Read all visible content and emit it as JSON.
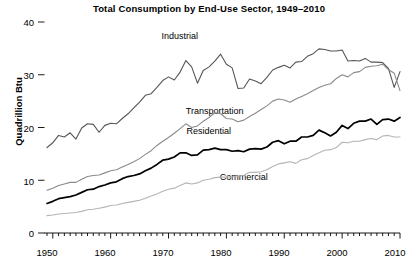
{
  "chart_data": {
    "type": "line",
    "title": "Total Consumption by End-Use Sector, 1949–2010",
    "xlabel": "",
    "ylabel": "Quadrillion Btu",
    "xlim": [
      1949,
      2010
    ],
    "ylim": [
      0,
      40
    ],
    "grid": false,
    "legend": "inline-annotations",
    "y_ticks": [
      0,
      10,
      20,
      30,
      40
    ],
    "y_tick_labels": [
      "0",
      "10",
      "20",
      "30",
      "40"
    ],
    "x_ticks": [
      1950,
      1960,
      1970,
      1980,
      1990,
      2000,
      2010
    ],
    "x_tick_labels": [
      "1950",
      "1960",
      "1970",
      "1980",
      "1990",
      "2000",
      "2010"
    ],
    "x_minor_tick_interval": 1,
    "x": [
      1949,
      1950,
      1951,
      1952,
      1953,
      1954,
      1955,
      1956,
      1957,
      1958,
      1959,
      1960,
      1961,
      1962,
      1963,
      1964,
      1965,
      1966,
      1967,
      1968,
      1969,
      1970,
      1971,
      1972,
      1973,
      1974,
      1975,
      1976,
      1977,
      1978,
      1979,
      1980,
      1981,
      1982,
      1983,
      1984,
      1985,
      1986,
      1987,
      1988,
      1989,
      1990,
      1991,
      1992,
      1993,
      1994,
      1995,
      1996,
      1997,
      1998,
      1999,
      2000,
      2001,
      2002,
      2003,
      2004,
      2005,
      2006,
      2007,
      2008,
      2009,
      2010
    ],
    "series": [
      {
        "name": "Industrial",
        "color": "#555555",
        "line_width": 1.1,
        "label_x": 1972,
        "label_y": 37.2,
        "values": [
          16.2,
          17.1,
          18.5,
          18.2,
          19.0,
          17.8,
          19.9,
          20.7,
          20.6,
          19.1,
          20.4,
          20.8,
          20.7,
          21.7,
          22.6,
          23.7,
          24.8,
          26.1,
          26.4,
          27.6,
          28.9,
          29.6,
          29.0,
          30.5,
          32.7,
          31.5,
          28.4,
          30.8,
          31.5,
          32.6,
          33.9,
          32.0,
          31.3,
          27.4,
          27.5,
          29.2,
          28.8,
          28.3,
          29.5,
          30.9,
          31.4,
          31.8,
          31.3,
          32.4,
          32.5,
          33.5,
          34.0,
          34.9,
          34.8,
          34.5,
          34.5,
          34.7,
          32.6,
          32.7,
          32.6,
          33.1,
          32.4,
          32.4,
          32.3,
          31.2,
          27.6,
          30.6
        ]
      },
      {
        "name": "Transportation",
        "color": "#8a8a8a",
        "line_width": 1.1,
        "label_x": 1978,
        "label_y": 23.0,
        "values": [
          8.1,
          8.5,
          9.0,
          9.3,
          9.6,
          9.6,
          10.2,
          10.7,
          10.9,
          11.0,
          11.4,
          11.8,
          12.0,
          12.5,
          13.0,
          13.5,
          14.1,
          14.9,
          15.6,
          16.6,
          17.4,
          18.1,
          18.9,
          19.8,
          20.7,
          20.0,
          20.3,
          21.2,
          21.9,
          22.8,
          22.6,
          21.7,
          21.6,
          21.1,
          21.4,
          22.1,
          22.7,
          23.4,
          24.1,
          25.0,
          25.4,
          25.2,
          24.8,
          25.4,
          25.9,
          26.4,
          27.0,
          27.6,
          28.0,
          28.3,
          29.3,
          30.0,
          29.6,
          30.4,
          30.6,
          31.4,
          31.6,
          31.7,
          32.0,
          31.0,
          30.3,
          27.0
        ]
      },
      {
        "name": "Residential",
        "color": "#000000",
        "line_width": 1.7,
        "label_x": 1977,
        "label_y": 19.1,
        "values": [
          5.6,
          6.0,
          6.5,
          6.7,
          6.9,
          7.2,
          7.7,
          8.2,
          8.3,
          8.8,
          9.1,
          9.5,
          9.7,
          10.3,
          10.7,
          10.9,
          11.2,
          11.8,
          12.3,
          13.0,
          13.8,
          14.0,
          14.4,
          15.2,
          15.2,
          14.7,
          14.8,
          15.7,
          15.8,
          16.1,
          15.8,
          15.8,
          15.5,
          15.6,
          15.4,
          15.9,
          16.0,
          15.9,
          16.3,
          17.2,
          17.5,
          16.9,
          17.4,
          17.4,
          18.2,
          18.2,
          18.5,
          19.5,
          19.0,
          18.4,
          19.1,
          20.4,
          19.8,
          20.8,
          21.2,
          21.2,
          21.6,
          20.6,
          21.5,
          21.6,
          21.2,
          21.9
        ]
      },
      {
        "name": "Commercial",
        "color": "#b5b5b5",
        "line_width": 1.1,
        "label_x": 1983,
        "label_y": 10.4,
        "values": [
          3.3,
          3.4,
          3.6,
          3.7,
          3.8,
          3.9,
          4.1,
          4.4,
          4.5,
          4.7,
          4.9,
          5.2,
          5.3,
          5.6,
          5.8,
          6.0,
          6.2,
          6.6,
          7.0,
          7.4,
          7.9,
          8.3,
          8.5,
          9.0,
          9.5,
          9.3,
          9.5,
          10.0,
          10.2,
          10.5,
          10.6,
          10.6,
          10.6,
          10.8,
          10.9,
          11.5,
          11.5,
          11.6,
          12.0,
          12.6,
          13.1,
          13.3,
          13.5,
          13.2,
          13.9,
          14.1,
          14.7,
          15.2,
          15.7,
          15.8,
          16.2,
          17.2,
          17.1,
          17.4,
          17.4,
          17.7,
          17.9,
          17.7,
          18.4,
          18.5,
          18.2,
          18.2
        ]
      }
    ]
  },
  "axes": {
    "y_label": "Quadrillion Btu",
    "y_ticks": [
      {
        "value": "40"
      },
      {
        "value": "30"
      },
      {
        "value": "20"
      },
      {
        "value": "10"
      },
      {
        "value": "0"
      }
    ],
    "x_ticks": [
      {
        "value": "1950"
      },
      {
        "value": "1960"
      },
      {
        "value": "1970"
      },
      {
        "value": "1980"
      },
      {
        "value": "1990"
      },
      {
        "value": "2000"
      },
      {
        "value": "2010"
      }
    ]
  },
  "annotations": [
    {
      "text": "Industrial"
    },
    {
      "text": "Transportation"
    },
    {
      "text": "Residential"
    },
    {
      "text": "Commercial"
    }
  ],
  "header": {
    "title": "Total Consumption by End-Use Sector, 1949–2010"
  }
}
